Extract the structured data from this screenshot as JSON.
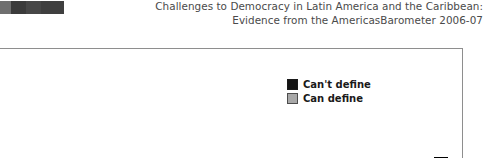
{
  "header": {
    "logo_name": "publisher-logo",
    "title_line_1": "Challenges to Democracy in Latin America and the Caribbean:",
    "title_line_2": "Evidence from the AmericasBarometer 2006-07"
  },
  "legend": {
    "position": "top-right-inside-plot",
    "entries": [
      {
        "label": "Can't define",
        "color": "#141414"
      },
      {
        "label": "Can define",
        "color": "#a8a8a8"
      }
    ]
  },
  "chart_data": {
    "type": "bar",
    "title": "Challenges to Democracy in Latin America and the Caribbean: Evidence from the AmericasBarometer 2006-07",
    "xlabel": "",
    "ylabel": "",
    "grid": false,
    "legend_position": "upper right",
    "note": "Grouped bar chart, cropped: x-axis baseline, tick labels and y-axis scale fall below the visible crop. Values are relative bar heights read off the visible pixels.",
    "categories": [
      "c01",
      "c02",
      "c03",
      "c04",
      "c05",
      "c06",
      "c07",
      "c08",
      "c09",
      "c10",
      "c11",
      "c12",
      "c13",
      "c14",
      "c15",
      "c16",
      "c17",
      "c18",
      "c19",
      "c20"
    ],
    "series": [
      {
        "name": "Can't define",
        "color": "#141414",
        "values": [
          null,
          null,
          null,
          null,
          null,
          null,
          null,
          null,
          4,
          13,
          25,
          33,
          30,
          43,
          52,
          null,
          null,
          null,
          null,
          null
        ]
      },
      {
        "name": "Can define",
        "color": "#a8a8a8",
        "values": [
          35,
          null,
          22,
          45,
          19,
          28,
          20,
          48,
          29,
          16,
          21,
          32,
          36,
          25,
          45,
          50,
          null,
          null,
          null,
          null
        ]
      }
    ]
  },
  "bars": [
    {
      "name": "bar-01-light",
      "series": "Can define",
      "left": 14,
      "width": 16,
      "height": 35
    },
    {
      "name": "bar-02-light",
      "series": "Can define",
      "left": 124,
      "width": 16,
      "height": 22
    },
    {
      "name": "bar-03-light",
      "series": "Can define",
      "left": 150,
      "width": 16,
      "height": 45
    },
    {
      "name": "bar-04-light",
      "series": "Can define",
      "left": 176,
      "width": 16,
      "height": 19
    },
    {
      "name": "bar-05-light",
      "series": "Can define",
      "left": 201,
      "width": 16,
      "height": 28
    },
    {
      "name": "bar-06-light",
      "series": "Can define",
      "left": 227,
      "width": 16,
      "height": 20
    },
    {
      "name": "bar-07-light",
      "series": "Can define",
      "left": 250,
      "width": 16,
      "height": 48
    },
    {
      "name": "bar-08-light",
      "series": "Can define",
      "left": 277,
      "width": 16,
      "height": 38
    },
    {
      "name": "bar-09-light",
      "series": "Can define",
      "left": 301,
      "width": 16,
      "height": 22
    },
    {
      "name": "bar-10-dark",
      "series": "Can't define",
      "left": 317,
      "width": 13,
      "height": 4
    },
    {
      "name": "bar-11-dark",
      "series": "Can't define",
      "left": 337,
      "width": 13,
      "height": 13
    },
    {
      "name": "bar-12-light",
      "series": "Can define",
      "left": 350,
      "width": 14,
      "height": 23
    },
    {
      "name": "bar-13-dark",
      "series": "Can't define",
      "left": 364,
      "width": 14,
      "height": 32
    },
    {
      "name": "bar-14-light",
      "series": "Can define",
      "left": 378,
      "width": 14,
      "height": 40
    },
    {
      "name": "bar-15-dark",
      "series": "Can't define",
      "left": 392,
      "width": 13,
      "height": 39
    },
    {
      "name": "bar-16-light",
      "series": "Can define",
      "left": 405,
      "width": 14,
      "height": 32
    },
    {
      "name": "bar-17-dark",
      "series": "Can't define",
      "left": 419,
      "width": 14,
      "height": 47
    },
    {
      "name": "bar-18-light",
      "series": "Can define",
      "left": 433,
      "width": 14,
      "height": 49
    },
    {
      "name": "bar-19-dark",
      "series": "Can't define",
      "left": 447,
      "width": 14,
      "height": 55
    },
    {
      "name": "bar-20-light",
      "series": "Can define",
      "left": 461,
      "width": 14,
      "height": 52
    }
  ]
}
